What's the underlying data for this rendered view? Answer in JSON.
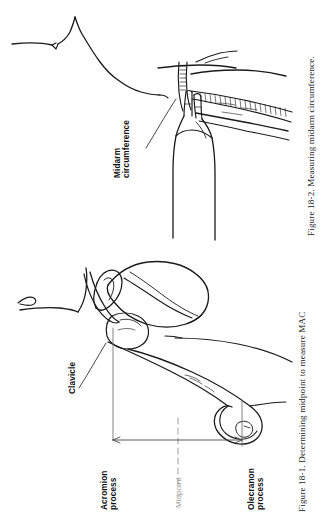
{
  "page": {
    "background": "#ffffff",
    "ink": "#111111",
    "muted_ink": "#9a9a9a",
    "width": 336,
    "height": 516
  },
  "figures": [
    {
      "id": "figure-18-2",
      "caption": "Figure 18-2.  Measuring midarm circumference.",
      "caption_number": "Figure 18-2.",
      "caption_text": "Measuring midarm circumference.",
      "subject": "line-drawing of a hand holding a tape measure around a patient's upper arm",
      "labels": [
        {
          "name": "midarm-circumference",
          "line1": "Midarm",
          "line2": "circumference",
          "style": "bold",
          "color": "#111111"
        }
      ]
    },
    {
      "id": "figure-18-1",
      "caption": "Figure 18-1.  Determining midpoint to measure MAC",
      "caption_number": "Figure 18-1.",
      "caption_text": "Determining midpoint to measure MAC",
      "subject": "line-drawing of shoulder girdle and humerus with a span arrow from acromion process to olecranon process",
      "labels": [
        {
          "name": "clavicle",
          "line1": "Clavicle",
          "line2": "",
          "style": "bold",
          "color": "#111111"
        },
        {
          "name": "acromion-process",
          "line1": "Acromion",
          "line2": "process",
          "style": "bold",
          "color": "#111111"
        },
        {
          "name": "midpoint",
          "line1": "Midpoint",
          "line2": "",
          "style": "muted",
          "color": "#9a9a9a"
        },
        {
          "name": "olecranon-process",
          "line1": "Olecranon",
          "line2": "process",
          "style": "bold",
          "color": "#111111"
        }
      ]
    }
  ]
}
